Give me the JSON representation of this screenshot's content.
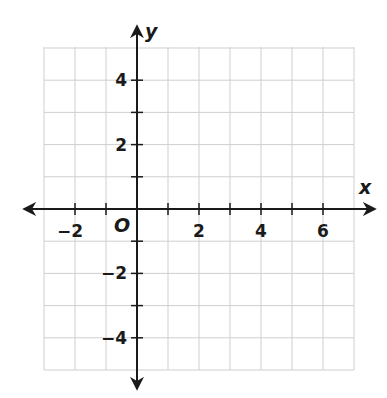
{
  "chart_data": {
    "type": "coordinate-grid",
    "title": "",
    "xlabel": "x",
    "ylabel": "y",
    "origin_label": "O",
    "xlim": [
      -3,
      7
    ],
    "ylim": [
      -5,
      5
    ],
    "grid": true,
    "grid_step": 1,
    "x_tick_labels": [
      "−2",
      "2",
      "4",
      "6"
    ],
    "x_tick_values": [
      -2,
      2,
      4,
      6
    ],
    "y_tick_labels": [
      "4",
      "2",
      "−2",
      "−4"
    ],
    "y_tick_values": [
      4,
      2,
      -2,
      -4
    ],
    "series": []
  },
  "colors": {
    "axis": "#1a1a1a",
    "grid": "#cfcfcf",
    "background": "#ffffff"
  }
}
